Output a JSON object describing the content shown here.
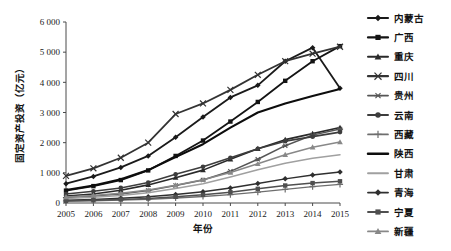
{
  "chart_data": {
    "type": "line",
    "title": "",
    "xlabel": "年份",
    "ylabel": "固定资产投资（亿元）",
    "x": [
      "2005",
      "2006",
      "2007",
      "2008",
      "2009",
      "2010",
      "2011",
      "2012",
      "2013",
      "2014",
      "2015"
    ],
    "categories": [
      "2005",
      "2006",
      "2007",
      "2008",
      "2009",
      "2010",
      "2011",
      "2012",
      "2013",
      "2014",
      "2015"
    ],
    "ylim": [
      0,
      6000
    ],
    "yticks": [
      0,
      1000,
      2000,
      3000,
      4000,
      5000,
      6000
    ],
    "ytick_labels": [
      "0",
      "1 000",
      "2 000",
      "3 000",
      "4 000",
      "5 000",
      "6 000"
    ],
    "grid": false,
    "legend_position": "right",
    "series": [
      {
        "name": "内蒙古",
        "marker": "diamond",
        "color": "#1a1a1a",
        "width": 1.8,
        "values": [
          640,
          880,
          1180,
          1560,
          2180,
          2850,
          3500,
          3900,
          4700,
          5150,
          3800
        ]
      },
      {
        "name": "广西",
        "marker": "square",
        "color": "#141414",
        "width": 1.8,
        "values": [
          410,
          560,
          760,
          1080,
          1560,
          2070,
          2700,
          3350,
          4050,
          4700,
          5200
        ]
      },
      {
        "name": "重庆",
        "marker": "triangle",
        "color": "#2a2a2a",
        "width": 1.6,
        "values": [
          230,
          300,
          420,
          600,
          840,
          1090,
          1450,
          1800,
          2100,
          2300,
          2500
        ]
      },
      {
        "name": "四川",
        "marker": "cross",
        "color": "#333333",
        "width": 1.8,
        "values": [
          900,
          1150,
          1500,
          2000,
          2950,
          3300,
          3750,
          4250,
          4700,
          4950,
          5180
        ]
      },
      {
        "name": "贵州",
        "marker": "star",
        "color": "#555555",
        "width": 1.5,
        "values": [
          180,
          230,
          300,
          410,
          580,
          760,
          1050,
          1450,
          1900,
          2250,
          2450
        ]
      },
      {
        "name": "云南",
        "marker": "circle",
        "color": "#3d3d3d",
        "width": 1.6,
        "values": [
          300,
          390,
          500,
          680,
          950,
          1200,
          1500,
          1800,
          2050,
          2200,
          2350
        ]
      },
      {
        "name": "西藏",
        "marker": "plus",
        "color": "#6e6e6e",
        "width": 1.3,
        "values": [
          60,
          75,
          95,
          120,
          165,
          215,
          280,
          360,
          450,
          540,
          620
        ]
      },
      {
        "name": "陕西",
        "marker": "none",
        "color": "#0d0d0d",
        "width": 2.1,
        "values": [
          430,
          580,
          790,
          1090,
          1520,
          1950,
          2500,
          3000,
          3300,
          3550,
          3780
        ]
      },
      {
        "name": "甘肃",
        "marker": "none",
        "color": "#a0a0a0",
        "width": 1.5,
        "values": [
          150,
          190,
          250,
          340,
          480,
          640,
          860,
          1100,
          1320,
          1480,
          1600
        ]
      },
      {
        "name": "青海",
        "marker": "diamond",
        "color": "#2f2f2f",
        "width": 1.5,
        "values": [
          95,
          120,
          155,
          205,
          280,
          370,
          500,
          650,
          800,
          930,
          1030
        ]
      },
      {
        "name": "宁夏",
        "marker": "square",
        "color": "#4f4f4f",
        "width": 1.5,
        "values": [
          70,
          90,
          115,
          150,
          205,
          270,
          360,
          470,
          580,
          660,
          720
        ]
      },
      {
        "name": "新疆",
        "marker": "triangle",
        "color": "#888888",
        "width": 1.5,
        "values": [
          200,
          250,
          320,
          430,
          590,
          770,
          1010,
          1300,
          1600,
          1850,
          2020
        ]
      }
    ]
  },
  "legend": {
    "items": [
      {
        "label": "内蒙古"
      },
      {
        "label": "广西"
      },
      {
        "label": "重庆"
      },
      {
        "label": "四川"
      },
      {
        "label": "贵州"
      },
      {
        "label": "云南"
      },
      {
        "label": "西藏"
      },
      {
        "label": "陕西"
      },
      {
        "label": "甘肃"
      },
      {
        "label": "青海"
      },
      {
        "label": "宁夏"
      },
      {
        "label": "新疆"
      }
    ]
  }
}
